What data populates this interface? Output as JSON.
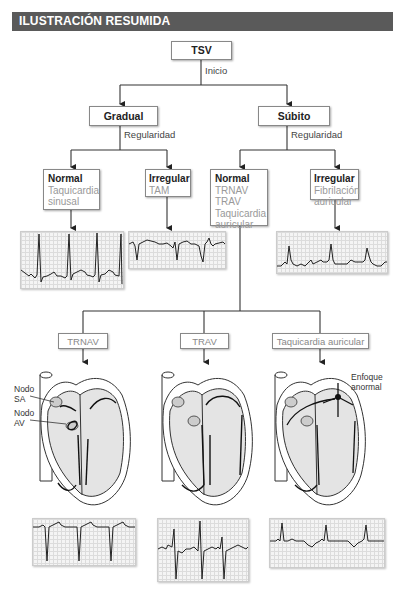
{
  "header": {
    "title": "ILUSTRACIÓN RESUMIDA",
    "color": "#5a5a5a"
  },
  "tree": {
    "root": {
      "label": "TSV",
      "edge_label": "Inicio"
    },
    "level2": [
      {
        "label": "Gradual",
        "edge_label": "Regularidad"
      },
      {
        "label": "Súbito",
        "edge_label": "Regularidad"
      }
    ],
    "level3": [
      {
        "title": "Normal",
        "items": [
          "Taquicardia",
          "sinusal"
        ]
      },
      {
        "title": "Irregular",
        "items": [
          "TAM"
        ]
      },
      {
        "title": "Normal",
        "items": [
          "TRNAV",
          "TRAV",
          "Taquicardia",
          "auricular"
        ]
      },
      {
        "title": "Irregular",
        "items": [
          "Fibrilación",
          "auricular"
        ]
      }
    ],
    "level4": [
      {
        "label": "TRNAV"
      },
      {
        "label": "TRAV"
      },
      {
        "label": "Taquicardia auricular"
      }
    ]
  },
  "heart_labels": {
    "sa_node": [
      "Nodo",
      "SA"
    ],
    "av_node": [
      "Nodo",
      "AV"
    ],
    "ectopic_focus": [
      "Enfoque",
      "anormal"
    ]
  },
  "ecg_strips": [
    {
      "name": "sinus-tachycardia",
      "position": "top-left"
    },
    {
      "name": "multifocal-atrial-tachycardia",
      "position": "top-middle"
    },
    {
      "name": "atrial-fibrillation",
      "position": "top-right"
    },
    {
      "name": "avnrt",
      "position": "bottom-left"
    },
    {
      "name": "avrt",
      "position": "bottom-middle"
    },
    {
      "name": "atrial-tachycardia",
      "position": "bottom-right"
    }
  ]
}
